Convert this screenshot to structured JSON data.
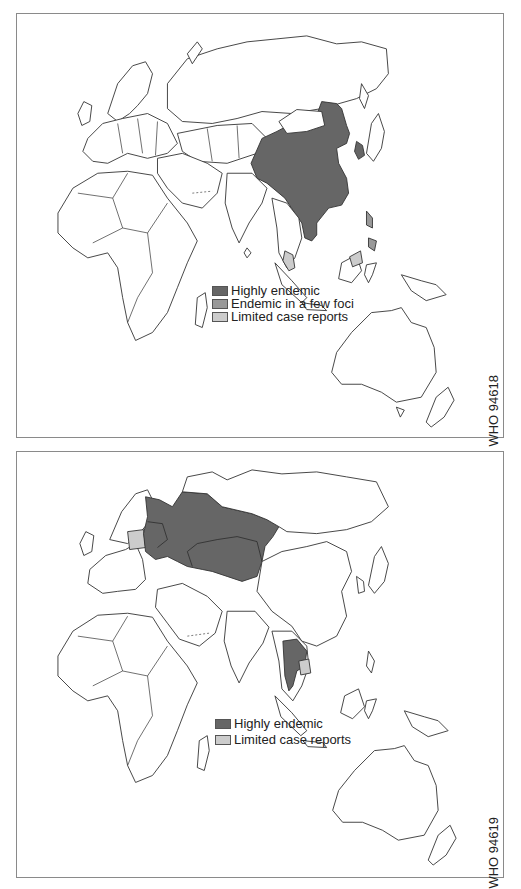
{
  "maps": [
    {
      "id_code": "WHO 94618",
      "legend": [
        {
          "label": "Highly endemic",
          "color": "#666666"
        },
        {
          "label": "Endemic in a few foci",
          "color": "#999999"
        },
        {
          "label": "Limited case reports",
          "color": "#cccccc"
        }
      ],
      "shaded_regions": [
        {
          "region": "China",
          "category": "Highly endemic"
        },
        {
          "region": "Korea",
          "category": "Highly endemic"
        },
        {
          "region": "Viet Nam",
          "category": "Highly endemic"
        },
        {
          "region": "Philippines",
          "category": "Endemic in a few foci"
        },
        {
          "region": "Malaysia / Borneo",
          "category": "Limited case reports"
        },
        {
          "region": "Thailand (south)",
          "category": "Limited case reports"
        }
      ]
    },
    {
      "id_code": "WHO 94619",
      "legend": [
        {
          "label": "Highly endemic",
          "color": "#666666"
        },
        {
          "label": "Limited case reports",
          "color": "#cccccc"
        }
      ],
      "shaded_regions": [
        {
          "region": "Russian Federation (west/central)",
          "category": "Highly endemic"
        },
        {
          "region": "Kazakhstan",
          "category": "Highly endemic"
        },
        {
          "region": "Baltic states / Belarus / Ukraine",
          "category": "Highly endemic"
        },
        {
          "region": "Thailand / Laos",
          "category": "Highly endemic"
        },
        {
          "region": "Poland",
          "category": "Limited case reports"
        },
        {
          "region": "Cambodia",
          "category": "Limited case reports"
        }
      ]
    }
  ],
  "colors": {
    "highly_endemic": "#666666",
    "few_foci": "#999999",
    "limited": "#cccccc",
    "outline": "#333333",
    "frame": "#8a8a8a"
  }
}
